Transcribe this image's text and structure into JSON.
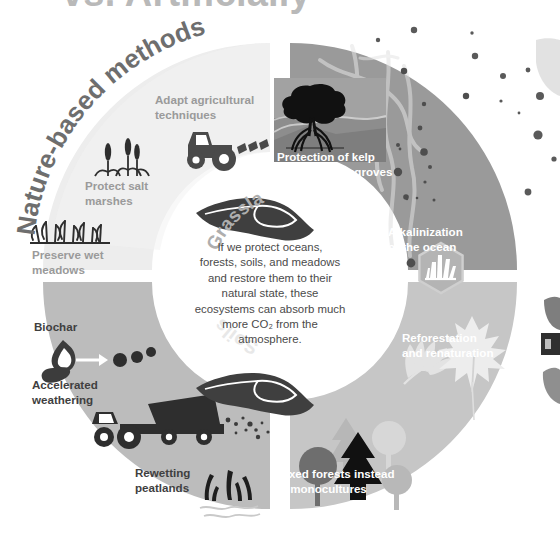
{
  "headline": "vs. Artificially",
  "wheel": {
    "arc_labels": [
      {
        "key": "nature_based",
        "text": "Nature-based methods"
      },
      {
        "key": "grassland",
        "text": "Grassland"
      },
      {
        "key": "ocean",
        "text": "Ocean"
      },
      {
        "key": "forests",
        "text": "Forests"
      },
      {
        "key": "soils",
        "text": "Soils"
      }
    ],
    "center_paragraph": "If we protect oceans, forests, soils, and meadows and restore them to their natural state, these ecosystems can absorb much more CO₂ from the atmosphere.",
    "center_lines": [
      "If we protect oceans,",
      "forests, soils, and meadows",
      "and restore them to their",
      "natural state, these",
      "ecosystems can absorb much",
      "more CO₂ from the",
      "atmosphere."
    ],
    "quadrants": [
      {
        "key": "grassland",
        "name": "Grassland",
        "color": "#ededed",
        "text_color": "#9a9a9a",
        "items": [
          {
            "label": "Adapt agricultural\ntechniques",
            "icon": "tractor-icon"
          },
          {
            "label": "Protect salt\nmarshes",
            "icon": "reeds-icon"
          },
          {
            "label": "Preserve wet\nmeadows",
            "icon": "wet-meadow-grass-icon"
          }
        ]
      },
      {
        "key": "ocean",
        "name": "Ocean",
        "color": "#9a9a9a",
        "text_color": "#ffffff",
        "items": [
          {
            "label": "Protection of kelp\nforests & mangroves",
            "icon": "mangrove-tree-icon"
          },
          {
            "label": "Alkalinization\nof the ocean",
            "icon": "mineral-crystal-icon"
          }
        ]
      },
      {
        "key": "forests",
        "name": "Forests",
        "color": "#c6c6c6",
        "text_color": "#ffffff",
        "items": [
          {
            "label": "Reforestation\nand renaturation",
            "icon": "leaves-icon"
          },
          {
            "label": "Mixed forests instead\nof monocultures",
            "icon": "mixed-trees-icon"
          }
        ]
      },
      {
        "key": "soils",
        "name": "Soils",
        "color": "#bcbcbc",
        "text_color": "#3f3f3f",
        "items": [
          {
            "label": "Biochar",
            "icon": "biochar-flame-icon"
          },
          {
            "label": "Accelerated\nweathering",
            "icon": "tractor-trailer-icon"
          },
          {
            "label": "Rewetting\npeatlands",
            "icon": "peatland-grass-icon"
          }
        ]
      }
    ],
    "hand_icons": [
      {
        "key": "hand-top",
        "name": "cupped-hand-icon"
      },
      {
        "key": "hand-bottom",
        "name": "cupped-hand-icon"
      }
    ]
  },
  "colors": {
    "headline": "#b9b9b9",
    "grassland": "#ededed",
    "ocean": "#9a9a9a",
    "forests": "#c6c6c6",
    "soils": "#bcbcbc",
    "center_fill": "#ffffff",
    "dark_ink": "#3f3f3f",
    "page_background": "#ffffff"
  }
}
